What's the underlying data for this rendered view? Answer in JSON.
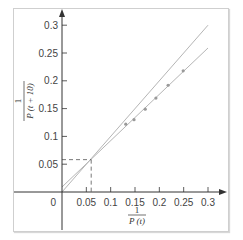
{
  "chart_data": {
    "type": "scatter",
    "title": "",
    "xlabel": "1 / P(t)",
    "ylabel": "1 / P(t + 10)",
    "xlabel_parts": {
      "numerator": "1",
      "denominator": "P (t)"
    },
    "ylabel_parts": {
      "numerator": "1",
      "denominator": "P (t + 10)"
    },
    "xlim": [
      0,
      0.3
    ],
    "ylim": [
      0,
      0.3
    ],
    "grid": false,
    "legend": null,
    "x_ticks": [
      {
        "value": 0.05,
        "label": "0.05"
      },
      {
        "value": 0.1,
        "label": "0.1"
      },
      {
        "value": 0.15,
        "label": "0.15"
      },
      {
        "value": 0.2,
        "label": "0.2"
      },
      {
        "value": 0.25,
        "label": "0.25"
      },
      {
        "value": 0.3,
        "label": "0.3"
      }
    ],
    "y_ticks": [
      {
        "value": 0.05,
        "label": "0.05"
      },
      {
        "value": 0.1,
        "label": "0.1"
      },
      {
        "value": 0.15,
        "label": "0.15"
      },
      {
        "value": 0.2,
        "label": "0.2"
      },
      {
        "value": 0.25,
        "label": "0.25"
      },
      {
        "value": 0.3,
        "label": "0.3"
      }
    ],
    "origin_label": "0",
    "series": [
      {
        "name": "data points",
        "kind": "scatter",
        "x": [
          0.131,
          0.148,
          0.171,
          0.193,
          0.218,
          0.249
        ],
        "y": [
          0.122,
          0.13,
          0.149,
          0.169,
          0.192,
          0.218
        ]
      },
      {
        "name": "line y = x",
        "kind": "line",
        "x": [
          0,
          0.3
        ],
        "y": [
          0,
          0.3
        ]
      },
      {
        "name": "fitted line",
        "kind": "line",
        "x": [
          0,
          0.3
        ],
        "y": [
          0.009,
          0.259
        ]
      }
    ],
    "annotations": [
      {
        "type": "dashed-guide",
        "x": 0.06,
        "y": 0.06,
        "description": "intersection of the two lines"
      }
    ]
  },
  "colors": {
    "axis": "#333333",
    "line": "#b5b5b5",
    "points": "#9a9a9a",
    "dashed": "#555555",
    "frame": "#cfcfcf"
  }
}
